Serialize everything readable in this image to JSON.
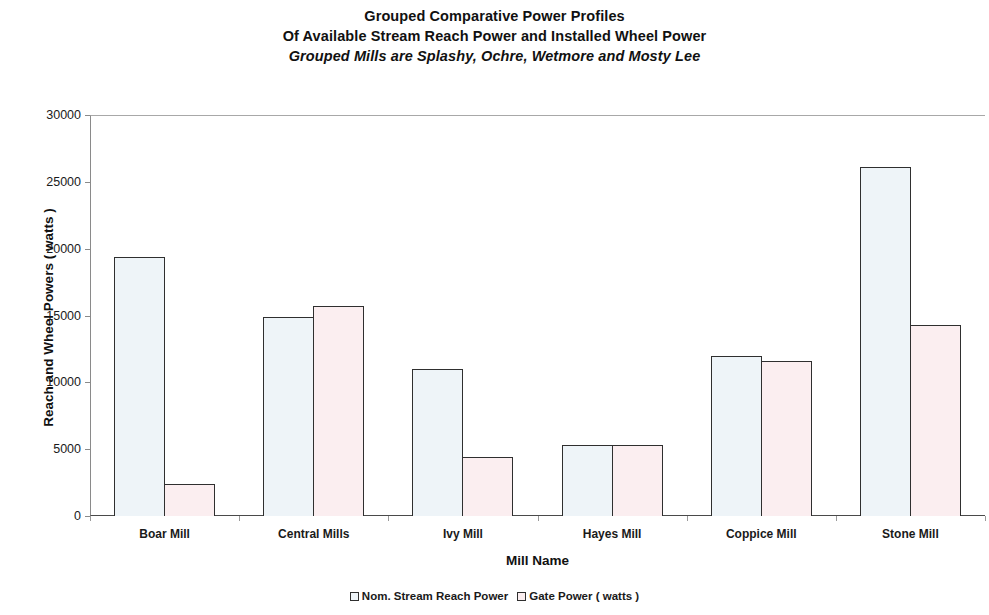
{
  "chart_data": {
    "type": "bar",
    "title": "Grouped Comparative Power Profiles",
    "title_lines": [
      "Grouped Comparative Power Profiles",
      "Of Available Stream Reach Power and Installed Wheel Power",
      "Grouped Mills are Splashy, Ochre, Wetmore and Mosty Lee"
    ],
    "xlabel": "Mill Name",
    "ylabel": "Reach and Wheel Powers ( watts )",
    "ylim": [
      0,
      30000
    ],
    "yticks": [
      0,
      5000,
      10000,
      15000,
      20000,
      25000,
      30000
    ],
    "ytick_labels": [
      "0",
      "5000",
      "10000",
      "15000",
      "20000",
      "25000",
      "30000"
    ],
    "grid": false,
    "legend_position": "bottom",
    "categories": [
      "Boar Mill",
      "Central Mills",
      "Ivy Mill",
      "Hayes Mill",
      "Coppice Mill",
      "Stone Mill"
    ],
    "series": [
      {
        "name": "Nom. Stream Reach Power",
        "color": "#eef4f8",
        "values": [
          19400,
          14900,
          11000,
          5300,
          12000,
          26100
        ]
      },
      {
        "name": "Gate Power ( watts )",
        "color": "#fbeef0",
        "values": [
          2400,
          15700,
          4450,
          5300,
          11600,
          14300
        ]
      }
    ]
  }
}
